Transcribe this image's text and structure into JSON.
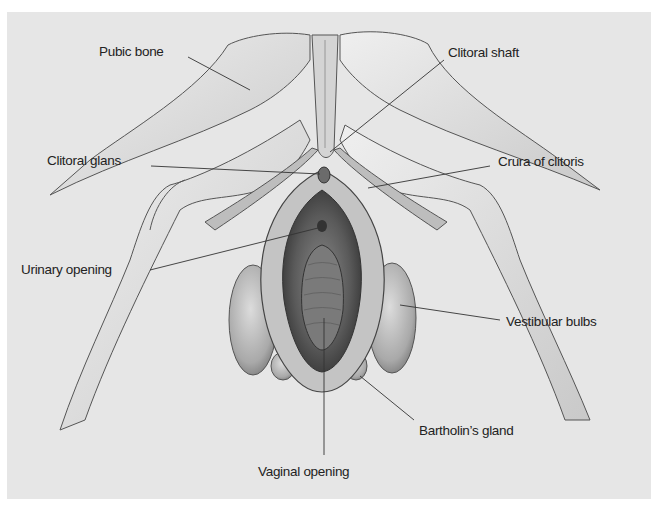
{
  "figure": {
    "background_color": "#e6e6e6",
    "ink_color": "#222222"
  },
  "labels": [
    {
      "id": "pubic-bone",
      "text": "Pubic bone",
      "x": 99,
      "y": 45,
      "anchor_end": [
        250,
        90
      ]
    },
    {
      "id": "clitoral-glans",
      "text": "Clitoral glans",
      "x": 47,
      "y": 154,
      "anchor_end": [
        322,
        175
      ]
    },
    {
      "id": "urinary-opening",
      "text": "Urinary opening",
      "x": 21,
      "y": 263,
      "anchor_end": [
        320,
        228
      ]
    },
    {
      "id": "clitoral-shaft",
      "text": "Clitoral shaft",
      "x": 448,
      "y": 46,
      "anchor_end": [
        330,
        153
      ]
    },
    {
      "id": "crura-of-clitoris",
      "text": "Crura of clitoris",
      "x": 498,
      "y": 155,
      "anchor_end": [
        368,
        188
      ]
    },
    {
      "id": "vestibular-bulbs",
      "text": "Vestibular bulbs",
      "x": 506,
      "y": 315,
      "anchor_end": [
        400,
        305
      ]
    },
    {
      "id": "bartholins-gland",
      "text": "Bartholin’s gland",
      "x": 419,
      "y": 424,
      "anchor_end": [
        360,
        375
      ]
    },
    {
      "id": "vaginal-opening",
      "text": "Vaginal opening",
      "x": 258,
      "y": 465,
      "anchor_end": [
        325,
        317
      ]
    }
  ]
}
